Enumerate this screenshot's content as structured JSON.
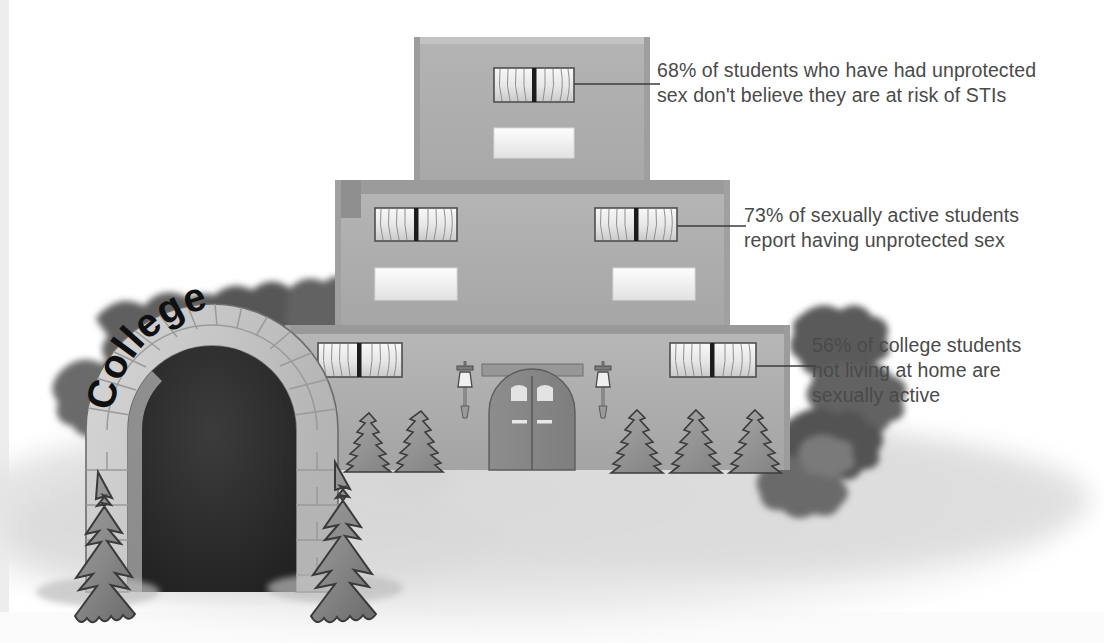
{
  "illustration": {
    "title": "College campus building with sexual health statistics callouts",
    "type": "informational-illustration",
    "style": "grayscale clip-art"
  },
  "building": {
    "sign_text": "College",
    "floors": [
      {
        "name": "top-floor",
        "windows": 1
      },
      {
        "name": "middle-floor",
        "windows": 2
      },
      {
        "name": "ground-floor",
        "windows": 2
      }
    ]
  },
  "callouts": [
    {
      "id": "callout-1",
      "stat": "68%",
      "text": "68% of students who have had unprotected\nsex don't believe they are at risk of STIs",
      "target": "top-floor-window"
    },
    {
      "id": "callout-2",
      "stat": "73%",
      "text": "73% of sexually active students\nreport having unprotected sex",
      "target": "middle-floor-right-window"
    },
    {
      "id": "callout-3",
      "stat": "56%",
      "text": "56% of college students\nnot living at home are\nsexually active",
      "target": "ground-floor-right-window"
    }
  ],
  "colors": {
    "background": "#ffffff",
    "wall_light": "#b9b9b9",
    "wall_mid": "#aeaeae",
    "wall_dark": "#9a9a9a",
    "wall_shadow": "#8a8a8a",
    "stone_light": "#cfcfcf",
    "stone_mid": "#c2c2c2",
    "tunnel_dark": "#2e2e2e",
    "foliage_dark": "#5c5c5c",
    "tree_mid": "#8e8e8e",
    "tree_outline": "#3a3a3a",
    "window_white": "#f4f4f4",
    "text_gray": "#4a4a4a",
    "leader_line": "#3c3c3c",
    "ground_shadow": "#d6d6d6"
  }
}
